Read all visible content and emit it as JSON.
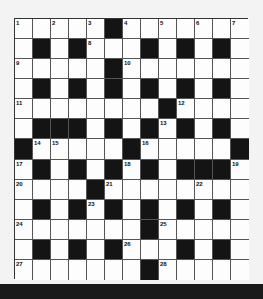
{
  "puzzle": {
    "type": "crossword",
    "size": 13,
    "rows": [
      "WWWWWBWWWWWWW",
      "WBWBWWWBWBWBW",
      "WWWWWBWWWWWWW",
      "WBWBWBWBWBWBW",
      "WWWWWWWWBWWWW",
      "WBBBWBWBWBWBW",
      "BWWWWWBWWWWWB",
      "WBWBWBWBWBBBW",
      "WWWWBWWWWWWWW",
      "WBWBWBWBWBWBW",
      "WWWWWWWBWWWWW",
      "WBWBWBWWWBWBW",
      "WWWWWWWBWWWWW"
    ],
    "numbers": [
      {
        "r": 0,
        "c": 0,
        "n": "1"
      },
      {
        "r": 0,
        "c": 2,
        "n": "2"
      },
      {
        "r": 0,
        "c": 4,
        "n": "3"
      },
      {
        "r": 0,
        "c": 6,
        "n": "4"
      },
      {
        "r": 0,
        "c": 8,
        "n": "5"
      },
      {
        "r": 0,
        "c": 10,
        "n": "6"
      },
      {
        "r": 0,
        "c": 12,
        "n": "7"
      },
      {
        "r": 1,
        "c": 4,
        "n": "8"
      },
      {
        "r": 2,
        "c": 0,
        "n": "9"
      },
      {
        "r": 2,
        "c": 6,
        "n": "10"
      },
      {
        "r": 4,
        "c": 0,
        "n": "11"
      },
      {
        "r": 4,
        "c": 9,
        "n": "12"
      },
      {
        "r": 5,
        "c": 8,
        "n": "13"
      },
      {
        "r": 6,
        "c": 1,
        "n": "14"
      },
      {
        "r": 6,
        "c": 2,
        "n": "15"
      },
      {
        "r": 6,
        "c": 7,
        "n": "16"
      },
      {
        "r": 7,
        "c": 0,
        "n": "17"
      },
      {
        "r": 7,
        "c": 6,
        "n": "18"
      },
      {
        "r": 7,
        "c": 12,
        "n": "19"
      },
      {
        "r": 8,
        "c": 0,
        "n": "20"
      },
      {
        "r": 8,
        "c": 5,
        "n": "21"
      },
      {
        "r": 8,
        "c": 10,
        "n": "22"
      },
      {
        "r": 9,
        "c": 4,
        "n": "23"
      },
      {
        "r": 10,
        "c": 0,
        "n": "24"
      },
      {
        "r": 10,
        "c": 8,
        "n": "25"
      },
      {
        "r": 11,
        "c": 6,
        "n": "26"
      },
      {
        "r": 12,
        "c": 0,
        "n": "27"
      },
      {
        "r": 12,
        "c": 8,
        "n": "28"
      }
    ]
  }
}
